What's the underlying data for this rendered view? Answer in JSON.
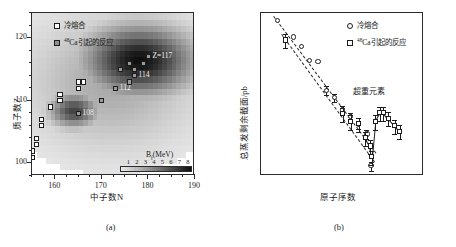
{
  "figure": {
    "panel_a_caption": "(a)",
    "panel_b_caption": "(b)"
  },
  "panel_a": {
    "xlabel": "中子数N",
    "ylabel": "质子数Z",
    "xticks": [
      "160",
      "170",
      "180",
      "190"
    ],
    "yticks": [
      "100",
      "110",
      "120"
    ],
    "legend": [
      {
        "label": "冷熔合",
        "marker": "open-square"
      },
      {
        "label": "48Ca引起的反应",
        "marker": "gray-square"
      }
    ],
    "colorbar": {
      "title": "Bf(MeV)",
      "ticks": [
        "1",
        "2",
        "3",
        "4",
        "5",
        "6",
        "7",
        "8"
      ]
    },
    "annotations": [
      {
        "text": "Z=117"
      },
      {
        "text": "114"
      },
      {
        "text": "112"
      },
      {
        "text": "108"
      }
    ]
  },
  "panel_b": {
    "xlabel": "原子序数",
    "ylabel": "总蒸发剩余截面/pb",
    "xticks": [
      "100",
      "105",
      "110",
      "115",
      "120"
    ],
    "yticks": [
      "10⁵",
      "10⁴",
      "10³",
      "10²",
      "10¹",
      "10⁰",
      "10⁻¹"
    ],
    "legend": [
      {
        "label": "冷熔合",
        "marker": "open-circle"
      },
      {
        "label": "48Ca引起的反应",
        "marker": "open-square"
      }
    ],
    "annotation": "超重元素"
  },
  "chart_data": [
    {
      "type": "heatmap",
      "title": "",
      "xlabel": "中子数N",
      "ylabel": "质子数Z",
      "xlim": [
        155,
        190
      ],
      "ylim": [
        98,
        124
      ],
      "colorbar_label": "Bf(MeV)",
      "colorbar_range": [
        0,
        8.5
      ],
      "grid": false,
      "overlay_points": [
        {
          "series": "冷熔合",
          "N": 157,
          "Z": 107
        },
        {
          "series": "冷熔合",
          "N": 157,
          "Z": 106
        },
        {
          "series": "冷熔合",
          "N": 156,
          "Z": 104
        },
        {
          "series": "冷熔合",
          "N": 156,
          "Z": 103
        },
        {
          "series": "冷熔合",
          "N": 155,
          "Z": 102
        },
        {
          "series": "冷熔合",
          "N": 155,
          "Z": 101
        },
        {
          "series": "冷熔合",
          "N": 159,
          "Z": 109
        },
        {
          "series": "冷熔合",
          "N": 161,
          "Z": 110
        },
        {
          "series": "冷熔合",
          "N": 161,
          "Z": 111
        },
        {
          "series": "冷熔合",
          "N": 165,
          "Z": 112
        },
        {
          "series": "冷熔合",
          "N": 165,
          "Z": 113
        },
        {
          "series": "冷熔合",
          "N": 166,
          "Z": 113
        },
        {
          "series": "48Ca引起的反应",
          "N": 165,
          "Z": 108,
          "label": "108"
        },
        {
          "series": "48Ca引起的反应",
          "N": 170,
          "Z": 110
        },
        {
          "series": "48Ca引起的反应",
          "N": 173,
          "Z": 112,
          "label": "112"
        },
        {
          "series": "48Ca引起的反应",
          "N": 176,
          "Z": 113
        },
        {
          "series": "48Ca引起的反应",
          "N": 177,
          "Z": 114,
          "label": "114"
        },
        {
          "series": "48Ca引起的反应",
          "N": 177,
          "Z": 115
        },
        {
          "series": "48Ca引起的反应",
          "N": 179,
          "Z": 116
        },
        {
          "series": "48Ca引起的反应",
          "N": 180,
          "Z": 117,
          "label": "Z=117"
        },
        {
          "series": "48Ca引起的反应",
          "N": 176,
          "Z": 116
        },
        {
          "series": "48Ca引起的反应",
          "N": 174,
          "Z": 115
        }
      ]
    },
    {
      "type": "scatter",
      "title": "",
      "xlabel": "原子序数",
      "ylabel": "总蒸发剩余截面/pb",
      "xlim": [
        100,
        120
      ],
      "ylim_log": [
        -2,
        5.6
      ],
      "log_y": true,
      "grid": false,
      "series": [
        {
          "name": "冷熔合",
          "marker": "open-circle",
          "points": [
            {
              "x": 102,
              "y": 180000
            },
            {
              "x": 104,
              "y": 30000
            },
            {
              "x": 105,
              "y": 11000
            },
            {
              "x": 106,
              "y": 2400
            },
            {
              "x": 107,
              "y": 2200
            },
            {
              "x": 108,
              "y": 100
            },
            {
              "x": 109,
              "y": 45
            },
            {
              "x": 110,
              "y": 12
            },
            {
              "x": 111,
              "y": 6
            },
            {
              "x": 112,
              "y": 2.5
            },
            {
              "x": 113,
              "y": 0.9
            },
            {
              "x": 113.5,
              "y": 0.03
            }
          ]
        },
        {
          "name": "48Ca引起的反应",
          "marker": "open-square",
          "points": [
            {
              "x": 103,
              "y": 22000
            },
            {
              "x": 110,
              "y": 8
            },
            {
              "x": 111,
              "y": 3.5
            },
            {
              "x": 112,
              "y": 2.8
            },
            {
              "x": 112.8,
              "y": 0.6
            },
            {
              "x": 113.4,
              "y": 0.25
            },
            {
              "x": 114,
              "y": 3.5
            },
            {
              "x": 114.6,
              "y": 9
            },
            {
              "x": 115,
              "y": 9
            },
            {
              "x": 115.6,
              "y": 5
            },
            {
              "x": 116.4,
              "y": 2.2
            },
            {
              "x": 117,
              "y": 1.2
            },
            {
              "x": 113.6,
              "y": 0.08
            }
          ]
        }
      ],
      "trend_lines": [
        {
          "name": "cold-fusion-trend",
          "style": "dashed"
        },
        {
          "name": "ca48-trend",
          "style": "dashed"
        },
        {
          "name": "superheavy-hump",
          "style": "solid"
        }
      ]
    }
  ]
}
